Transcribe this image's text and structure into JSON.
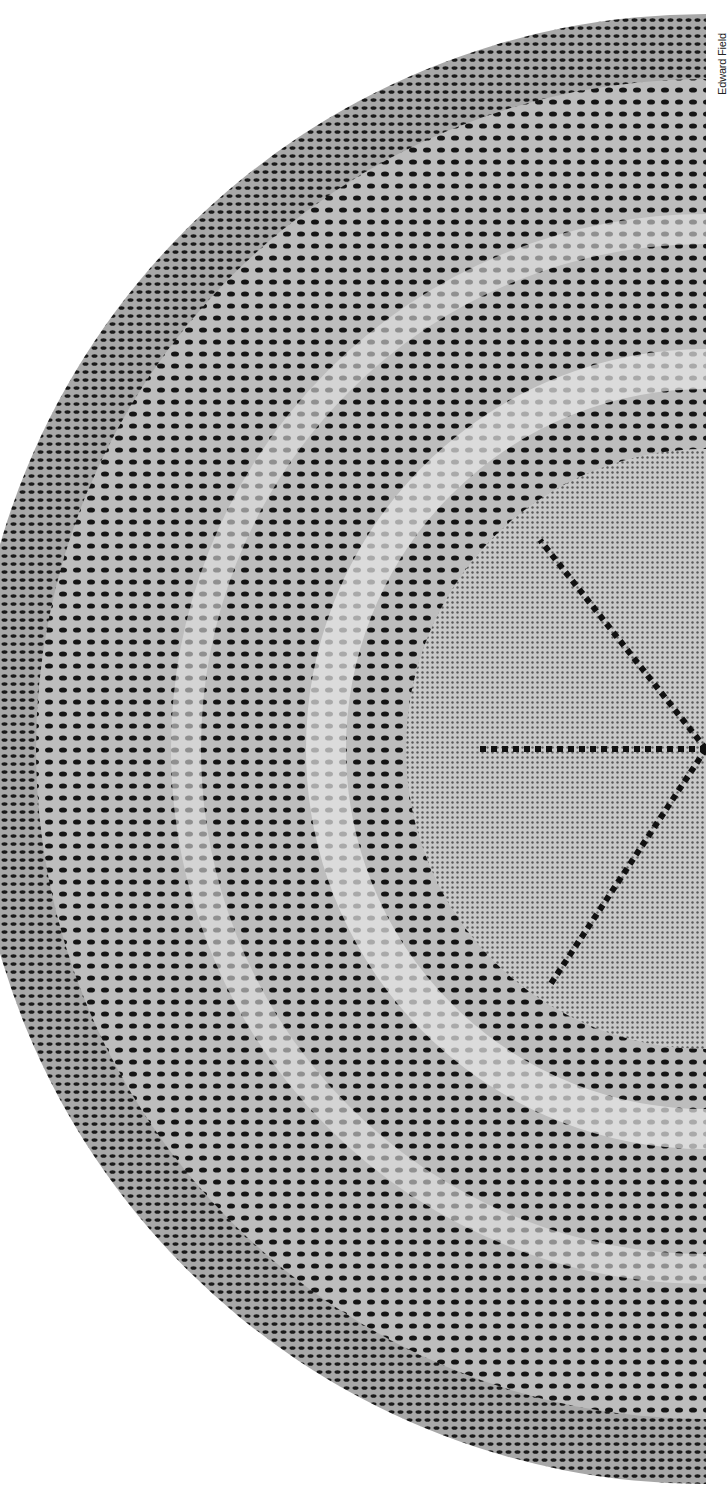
{
  "photo": {
    "subject": "Knitted lace circular shawl (half shown)",
    "description": "Semicircular view of a fine lace shawl with a scalloped border, feather-and-fan style wedge panels, and a plain center divided by eyelet lines radiating from the center",
    "colors": {
      "background": "#ffffff",
      "yarn": "#d6d6d6",
      "holes": "#111111",
      "mid": "#8a8a8a"
    }
  },
  "credit": {
    "text": "Edward Field"
  }
}
